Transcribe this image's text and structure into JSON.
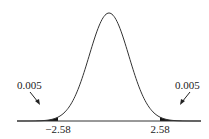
{
  "chart_data": {
    "type": "area",
    "title": "",
    "xlabel": "",
    "ylabel": "",
    "critical_values": [
      -2.58,
      2.58
    ],
    "tick_labels": [
      "−2.58",
      "2.58"
    ],
    "tail_areas": [
      0.005,
      0.005
    ],
    "annotations": [
      {
        "text": "0.005",
        "side": "left"
      },
      {
        "text": "0.005",
        "side": "right"
      }
    ],
    "colors": {
      "curve": "#333333",
      "shade": "#111111",
      "background": "#ffffff"
    },
    "grid": false,
    "legend": null
  },
  "labels": {
    "left_area": "0.005",
    "right_area": "0.005",
    "left_crit": "−2.58",
    "right_crit": "2.58"
  }
}
